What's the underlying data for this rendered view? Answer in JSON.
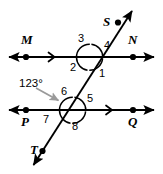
{
  "figure": {
    "type": "geometry-diagram",
    "background_color": "#ffffff",
    "stroke_color": "#000000",
    "pointer_color": "#9a9a9a"
  },
  "lines": {
    "line_mn": {
      "name": "MN",
      "left_label": "M",
      "right_label": "N",
      "tick_mark": "›"
    },
    "line_pq": {
      "name": "PQ",
      "left_label": "P",
      "right_label": "Q",
      "tick_mark": "›"
    },
    "transversal": {
      "name": "ST",
      "top_label": "S",
      "bottom_label": "T"
    }
  },
  "angles": {
    "top_intersection": {
      "upper_left": "3",
      "upper_right": "4",
      "lower_left": "2",
      "lower_right": "1"
    },
    "bottom_intersection": {
      "upper_left": "6",
      "upper_right": "5",
      "lower_left": "7",
      "lower_right": "8"
    }
  },
  "annotation": {
    "measure": "123°",
    "points_to": "6"
  }
}
